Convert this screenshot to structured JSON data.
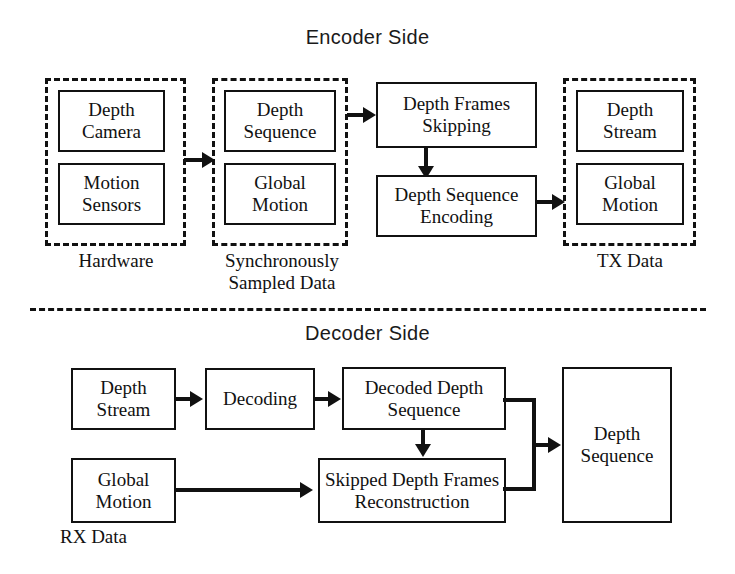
{
  "figure": {
    "encoder_title": "Encoder Side",
    "decoder_title": "Decoder Side"
  },
  "encoder": {
    "groups": [
      {
        "id": "hardware",
        "label": "Hardware",
        "boxes": [
          "Depth\nCamera",
          "Motion\nSensors"
        ]
      },
      {
        "id": "sync-sampled-data",
        "label": "Synchronously\nSampled Data",
        "boxes": [
          "Depth\nSequence",
          "Global\nMotion"
        ]
      },
      {
        "id": "tx-data",
        "label": "TX Data",
        "boxes": [
          "Depth\nStream",
          "Global\nMotion"
        ]
      }
    ],
    "process_boxes": [
      {
        "id": "depth-frames-skipping",
        "label": "Depth Frames\nSkipping"
      },
      {
        "id": "depth-sequence-encoding",
        "label": "Depth Sequence\nEncoding"
      }
    ],
    "hardware_box_1": "Depth\nCamera",
    "hardware_box_2": "Motion\nSensors",
    "hardware_label": "Hardware",
    "sync_box_1": "Depth\nSequence",
    "sync_box_2": "Global\nMotion",
    "sync_label": "Synchronously\nSampled Data",
    "skipping_box": "Depth Frames\nSkipping",
    "encoding_box": "Depth Sequence\nEncoding",
    "tx_box_1": "Depth\nStream",
    "tx_box_2": "Global\nMotion",
    "tx_label": "TX Data"
  },
  "decoder": {
    "depth_stream_box": "Depth\nStream",
    "decoding_box": "Decoding",
    "decoded_depth_sequence_box": "Decoded Depth\nSequence",
    "global_motion_box": "Global\nMotion",
    "rx_label": "RX Data",
    "skipped_reconstruction_box": "Skipped Depth Frames\nReconstruction",
    "depth_sequence_box": "Depth\nSequence"
  },
  "style": {
    "stroke": "#111111",
    "background": "#ffffff",
    "text": "#111111"
  }
}
